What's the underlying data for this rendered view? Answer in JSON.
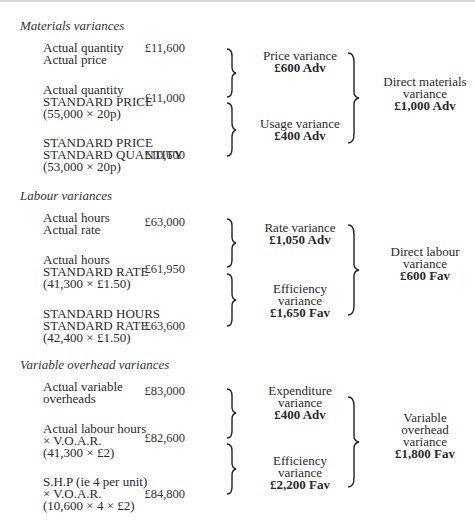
{
  "sections": [
    {
      "title": "Materials variances",
      "rows": [
        {
          "lines": [
            "Actual quantity",
            "Actual price"
          ],
          "amount": "£11,600"
        },
        {
          "lines": [
            "Actual quantity",
            "STANDARD PRICE",
            "(55,000 × 20p)"
          ],
          "amount": "£11,000"
        },
        {
          "lines": [
            "STANDARD PRICE",
            "STANDARD QUANTITY",
            "(53,000 × 20p)"
          ],
          "amount": "£10,600"
        }
      ],
      "sub_variances": [
        {
          "lines": [
            "Price variance"
          ],
          "value": "£600 Adv"
        },
        {
          "lines": [
            "Usage variance"
          ],
          "value": "£400 Adv"
        }
      ],
      "total": {
        "lines": [
          "Direct materials",
          "variance"
        ],
        "value": "£1,000 Adv"
      }
    },
    {
      "title": "Labour variances",
      "rows": [
        {
          "lines": [
            "Actual hours",
            "Actual rate"
          ],
          "amount": "£63,000"
        },
        {
          "lines": [
            "Actual hours",
            "STANDARD RATE",
            "(41,300 × £1.50)"
          ],
          "amount": "£61,950"
        },
        {
          "lines": [
            "STANDARD HOURS",
            "STANDARD RATE",
            "(42,400 × £1.50)"
          ],
          "amount": "£63,600"
        }
      ],
      "sub_variances": [
        {
          "lines": [
            "Rate variance"
          ],
          "value": "£1,050 Adv"
        },
        {
          "lines": [
            "Efficiency",
            "variance"
          ],
          "value": "£1,650 Fav"
        }
      ],
      "total": {
        "lines": [
          "Direct labour",
          "variance"
        ],
        "value": "£600 Fav"
      }
    },
    {
      "title": "Variable overhead variances",
      "rows": [
        {
          "lines": [
            "Actual variable",
            "overheads"
          ],
          "amount": "£83,000"
        },
        {
          "lines": [
            "Actual labour hours",
            "× V.O.A.R.",
            "(41,300 × £2)"
          ],
          "amount": "£82,600"
        },
        {
          "lines": [
            "S.H.P  (ie 4 per unit)",
            "× V.O.A.R.",
            "(10,600 × 4 × £2)"
          ],
          "amount": "£84,800"
        }
      ],
      "sub_variances": [
        {
          "lines": [
            "Expenditure",
            "variance"
          ],
          "value": "£400 Adv"
        },
        {
          "lines": [
            "Efficiency",
            "variance"
          ],
          "value": "£2,200 Fav"
        }
      ],
      "total": {
        "lines": [
          "Variable",
          "overhead",
          "variance"
        ],
        "value": "£1,800 Fav"
      }
    }
  ]
}
